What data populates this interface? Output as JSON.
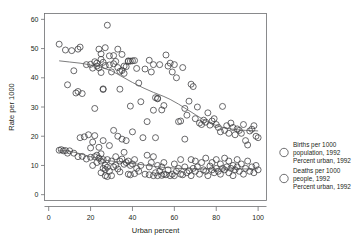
{
  "chart_data": {
    "type": "scatter",
    "title": "",
    "xlabel": "Urban percent",
    "ylabel": "Rate per 1000",
    "xlim": [
      -2,
      104
    ],
    "ylim": [
      -2,
      62
    ],
    "xticks": [
      0,
      20,
      40,
      60,
      80,
      100
    ],
    "yticks": [
      0,
      10,
      20,
      30,
      40,
      50,
      60
    ],
    "grid": false,
    "legend_position": "right-outside",
    "marker": "open-circle",
    "series": [
      {
        "name": "births",
        "legend_line1": "Births per 1000",
        "legend_line2": "population, 1992",
        "legend_line3": "Percent urban, 1992",
        "trend": "lowess",
        "trend_points": [
          [
            5,
            45.8
          ],
          [
            10,
            45.4
          ],
          [
            15,
            45.0
          ],
          [
            20,
            44.4
          ],
          [
            25,
            43.6
          ],
          [
            30,
            42.4
          ],
          [
            33,
            41.2
          ],
          [
            36,
            40.0
          ],
          [
            40,
            38.4
          ],
          [
            45,
            36.6
          ],
          [
            50,
            35.0
          ],
          [
            55,
            33.6
          ],
          [
            58,
            32.6
          ],
          [
            62,
            31.0
          ],
          [
            66,
            29.2
          ],
          [
            70,
            27.4
          ],
          [
            74,
            25.6
          ],
          [
            78,
            24.2
          ],
          [
            82,
            23.2
          ],
          [
            86,
            22.6
          ],
          [
            90,
            22.2
          ],
          [
            94,
            22.0
          ],
          [
            98,
            21.9
          ],
          [
            100,
            21.8
          ]
        ],
        "points": [
          [
            5,
            51.5
          ],
          [
            8,
            49.5
          ],
          [
            9,
            37.6
          ],
          [
            11,
            49.3
          ],
          [
            12,
            42.4
          ],
          [
            13,
            34.8
          ],
          [
            14,
            35.3
          ],
          [
            14,
            49.8
          ],
          [
            15,
            50.5
          ],
          [
            16,
            34.6
          ],
          [
            18,
            44.5
          ],
          [
            20,
            44.6
          ],
          [
            21,
            43.3
          ],
          [
            22,
            45.5
          ],
          [
            22,
            29.5
          ],
          [
            23,
            45.0
          ],
          [
            23,
            44.0
          ],
          [
            24,
            43.4
          ],
          [
            24,
            49.8
          ],
          [
            25,
            46.3
          ],
          [
            25,
            48.2
          ],
          [
            25,
            41.8
          ],
          [
            26,
            45.3
          ],
          [
            26,
            36.2
          ],
          [
            26,
            36.0
          ],
          [
            27,
            44.2
          ],
          [
            27,
            50.3
          ],
          [
            28,
            58.0
          ],
          [
            29,
            44.4
          ],
          [
            29,
            47.5
          ],
          [
            30,
            42.0
          ],
          [
            31,
            44.8
          ],
          [
            31,
            47.6
          ],
          [
            32,
            45.6
          ],
          [
            33,
            43.5
          ],
          [
            33,
            49.8
          ],
          [
            34,
            42.2
          ],
          [
            34,
            36.1
          ],
          [
            35,
            42.5
          ],
          [
            35,
            48.0
          ],
          [
            36,
            44.0
          ],
          [
            36,
            41.5
          ],
          [
            37,
            43.8
          ],
          [
            38,
            45.8
          ],
          [
            38,
            45.6
          ],
          [
            39,
            45.7
          ],
          [
            39,
            30.3
          ],
          [
            40,
            45.8
          ],
          [
            41,
            45.9
          ],
          [
            42,
            43.2
          ],
          [
            43,
            38.2
          ],
          [
            44,
            31.8
          ],
          [
            46,
            43.0
          ],
          [
            47,
            25.0
          ],
          [
            48,
            46.0
          ],
          [
            49,
            42.0
          ],
          [
            50,
            44.5
          ],
          [
            50,
            28.9
          ],
          [
            51,
            33.2
          ],
          [
            52,
            33.0
          ],
          [
            52,
            32.8
          ],
          [
            53,
            44.5
          ],
          [
            54,
            29.0
          ],
          [
            55,
            30.5
          ],
          [
            56,
            47.8
          ],
          [
            57,
            44.0
          ],
          [
            58,
            45.0
          ],
          [
            59,
            42.0
          ],
          [
            60,
            44.5
          ],
          [
            61,
            40.0
          ],
          [
            62,
            25.0
          ],
          [
            63,
            25.2
          ],
          [
            64,
            43.5
          ],
          [
            65,
            29.5
          ],
          [
            66,
            27.2
          ],
          [
            67,
            32.0
          ],
          [
            68,
            37.8
          ],
          [
            69,
            37.0
          ],
          [
            70,
            26.0
          ],
          [
            71,
            30.0
          ],
          [
            72,
            24.5
          ],
          [
            73,
            24.0
          ],
          [
            74,
            25.5
          ],
          [
            75,
            24.8
          ],
          [
            76,
            28.0
          ],
          [
            77,
            23.8
          ],
          [
            78,
            25.2
          ],
          [
            79,
            26.0
          ],
          [
            80,
            24.0
          ],
          [
            81,
            23.0
          ],
          [
            82,
            21.5
          ],
          [
            83,
            30.2
          ],
          [
            84,
            22.0
          ],
          [
            85,
            23.6
          ],
          [
            86,
            21.0
          ],
          [
            87,
            24.5
          ],
          [
            88,
            23.0
          ],
          [
            89,
            20.5
          ],
          [
            90,
            22.5
          ],
          [
            91,
            22.0
          ],
          [
            92,
            21.0
          ],
          [
            93,
            24.0
          ],
          [
            94,
            18.5
          ],
          [
            95,
            17.0
          ],
          [
            96,
            21.8
          ],
          [
            97,
            22.4
          ],
          [
            98,
            23.6
          ],
          [
            99,
            20.0
          ],
          [
            100,
            19.5
          ]
        ]
      },
      {
        "name": "deaths",
        "legend_line1": "Deaths per 1000",
        "legend_line2": "people, 1992",
        "legend_line3": "Percent urban, 1992",
        "trend": "lowess",
        "trend_points": [
          [
            5,
            15.2
          ],
          [
            9,
            15.0
          ],
          [
            13,
            14.4
          ],
          [
            17,
            13.6
          ],
          [
            21,
            12.8
          ],
          [
            24,
            12.2
          ],
          [
            27,
            11.8
          ],
          [
            30,
            11.5
          ],
          [
            34,
            11.2
          ],
          [
            38,
            10.9
          ],
          [
            42,
            10.5
          ],
          [
            46,
            10.1
          ],
          [
            50,
            9.7
          ],
          [
            54,
            9.4
          ],
          [
            58,
            9.2
          ],
          [
            62,
            9.0
          ],
          [
            66,
            8.9
          ],
          [
            70,
            8.8
          ],
          [
            74,
            8.8
          ],
          [
            78,
            8.8
          ],
          [
            82,
            8.8
          ],
          [
            86,
            8.8
          ],
          [
            90,
            8.8
          ],
          [
            95,
            8.8
          ],
          [
            100,
            8.8
          ]
        ],
        "points": [
          [
            5,
            15.2
          ],
          [
            6,
            15.4
          ],
          [
            7,
            15.0
          ],
          [
            8,
            15.1
          ],
          [
            9,
            14.2
          ],
          [
            10,
            15.0
          ],
          [
            12,
            14.2
          ],
          [
            14,
            13.0
          ],
          [
            15,
            19.5
          ],
          [
            16,
            13.1
          ],
          [
            17,
            19.8
          ],
          [
            18,
            12.2
          ],
          [
            19,
            20.5
          ],
          [
            20,
            12.8
          ],
          [
            20,
            16.0
          ],
          [
            21,
            18.0
          ],
          [
            21,
            10.0
          ],
          [
            22,
            13.0
          ],
          [
            22,
            20.2
          ],
          [
            23,
            13.5
          ],
          [
            23,
            11.0
          ],
          [
            24,
            12.5
          ],
          [
            24,
            16.2
          ],
          [
            25,
            11.5
          ],
          [
            25,
            14.0
          ],
          [
            25,
            7.5
          ],
          [
            26,
            9.0
          ],
          [
            26,
            12.0
          ],
          [
            26,
            18.5
          ],
          [
            27,
            8.6
          ],
          [
            27,
            10.0
          ],
          [
            27,
            6.5
          ],
          [
            28,
            9.4
          ],
          [
            28,
            12.0
          ],
          [
            28,
            6.2
          ],
          [
            29,
            8.0
          ],
          [
            29,
            16.8
          ],
          [
            30,
            6.5
          ],
          [
            30,
            11.5
          ],
          [
            31,
            9.5
          ],
          [
            31,
            22.0
          ],
          [
            32,
            10.0
          ],
          [
            32,
            13.0
          ],
          [
            33,
            8.8
          ],
          [
            33,
            20.0
          ],
          [
            34,
            7.8
          ],
          [
            34,
            11.5
          ],
          [
            35,
            12.2
          ],
          [
            35,
            19.0
          ],
          [
            36,
            10.4
          ],
          [
            36,
            14.5
          ],
          [
            37,
            11.0
          ],
          [
            37,
            18.5
          ],
          [
            38,
            11.5
          ],
          [
            38,
            7.0
          ],
          [
            39,
            10.0
          ],
          [
            39,
            6.8
          ],
          [
            40,
            10.5
          ],
          [
            40,
            21.5
          ],
          [
            41,
            12.0
          ],
          [
            41,
            7.2
          ],
          [
            42,
            9.0
          ],
          [
            43,
            8.0
          ],
          [
            44,
            10.0
          ],
          [
            45,
            19.5
          ],
          [
            46,
            7.0
          ],
          [
            47,
            13.5
          ],
          [
            48,
            9.5
          ],
          [
            48,
            6.8
          ],
          [
            49,
            11.0
          ],
          [
            50,
            6.5
          ],
          [
            50,
            13.0
          ],
          [
            51,
            7.5
          ],
          [
            51,
            19.5
          ],
          [
            52,
            10.0
          ],
          [
            52,
            6.5
          ],
          [
            53,
            8.0
          ],
          [
            54,
            6.6
          ],
          [
            54,
            9.5
          ],
          [
            55,
            7.0
          ],
          [
            55,
            11.0
          ],
          [
            56,
            6.8
          ],
          [
            57,
            8.5
          ],
          [
            58,
            6.5
          ],
          [
            59,
            7.0
          ],
          [
            60,
            10.5
          ],
          [
            60,
            6.5
          ],
          [
            61,
            8.0
          ],
          [
            62,
            9.0
          ],
          [
            63,
            12.0
          ],
          [
            63,
            7.0
          ],
          [
            64,
            6.8
          ],
          [
            65,
            9.5
          ],
          [
            65,
            19.0
          ],
          [
            66,
            7.5
          ],
          [
            67,
            8.2
          ],
          [
            68,
            12.0
          ],
          [
            68,
            6.5
          ],
          [
            69,
            9.0
          ],
          [
            70,
            8.0
          ],
          [
            70,
            11.5
          ],
          [
            71,
            9.5
          ],
          [
            72,
            7.0
          ],
          [
            73,
            11.0
          ],
          [
            74,
            8.5
          ],
          [
            75,
            8.0
          ],
          [
            75,
            12.5
          ],
          [
            76,
            6.5
          ],
          [
            77,
            9.8
          ],
          [
            78,
            8.5
          ],
          [
            78,
            11.0
          ],
          [
            79,
            7.5
          ],
          [
            80,
            9.0
          ],
          [
            80,
            12.0
          ],
          [
            81,
            8.0
          ],
          [
            82,
            10.5
          ],
          [
            82,
            7.0
          ],
          [
            83,
            9.0
          ],
          [
            84,
            12.5
          ],
          [
            84,
            8.5
          ],
          [
            85,
            9.5
          ],
          [
            86,
            7.5
          ],
          [
            86,
            11.5
          ],
          [
            87,
            9.0
          ],
          [
            88,
            10.0
          ],
          [
            88,
            6.5
          ],
          [
            89,
            8.5
          ],
          [
            90,
            9.5
          ],
          [
            90,
            12.0
          ],
          [
            91,
            8.0
          ],
          [
            92,
            10.5
          ],
          [
            93,
            7.0
          ],
          [
            94,
            9.0
          ],
          [
            95,
            11.5
          ],
          [
            96,
            8.0
          ],
          [
            97,
            9.5
          ],
          [
            98,
            7.5
          ],
          [
            99,
            10.0
          ],
          [
            100,
            8.5
          ]
        ]
      }
    ]
  },
  "legend": {
    "entries": [
      {
        "line1": "Births per 1000",
        "line2": "population, 1992",
        "line3": "Percent urban, 1992"
      },
      {
        "line1": "Deaths per 1000",
        "line2": "people, 1992",
        "line3": "Percent urban, 1992"
      }
    ]
  },
  "colors": {
    "marker_stroke": "#3a3a3c",
    "trend_stroke": "#5a5a5c",
    "axis": "#6d6e71",
    "text": "#231f20",
    "background": "#ffffff"
  }
}
